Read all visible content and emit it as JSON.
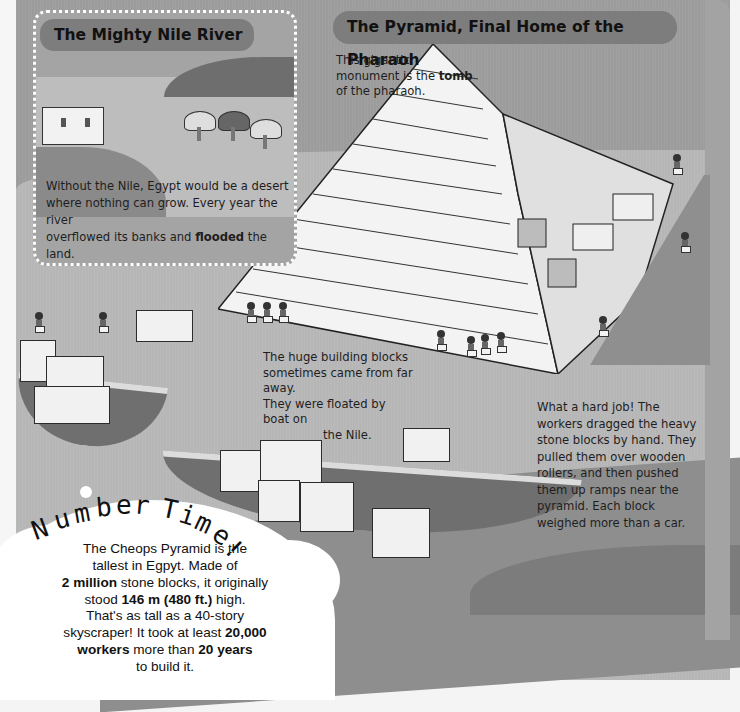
{
  "page": {
    "nile_section": {
      "title": "The Mighty Nile River",
      "body": {
        "line1": "Without the Nile, Egypt would be a desert",
        "line2": "where nothing can grow. Every year the river",
        "line3_pre": "overflowed its banks and ",
        "line3_bold": "flooded",
        "line3_post": " the land.",
        "line4": "When the waters receeded, farmers planted",
        "line5_pre": "crops in the rich mud, called ",
        "line5_bold": "silt",
        "line5_post": ", left behind."
      }
    },
    "pyramid_section": {
      "title": "The Pyramid, Final Home of the Pharaoh",
      "intro": {
        "pre": "This gigantic monument is the ",
        "bold": "tomb",
        "post": " of the pharaoh."
      },
      "blocks_caption": {
        "line1": "The huge building blocks",
        "line2": "sometimes came from far away.",
        "line3": "They were floated by boat on",
        "line4": "the Nile."
      },
      "hard_job_caption": {
        "line1": "What a hard job! The",
        "line2": "workers dragged the heavy",
        "line3": "stone blocks by hand. They",
        "line4": "pulled them over wooden",
        "line5": "rollers, and then pushed",
        "line6": "them up ramps near the",
        "line7": "pyramid. Each block",
        "line8": "weighed more than a car."
      }
    },
    "number_time": {
      "banner_letters": [
        "N",
        "u",
        "m",
        "b",
        "e",
        "r",
        " ",
        "T",
        "i",
        "m",
        "e",
        "!"
      ],
      "fact1": {
        "l1": "The Cheops Pyramid is the",
        "l2": "tallest in Egpyt. Made of",
        "l3_bold": "2 million",
        "l3_post": " stone blocks, it originally",
        "l4_pre": "stood ",
        "l4_bold": "146 m (480 ft.)",
        "l4_post": " high."
      },
      "fact2": {
        "l1": "That's as tall as a 40-story",
        "l2_pre": "skyscraper! It took at least ",
        "l2_bold": "20,000",
        "l3_bold": "workers",
        "l3_mid": " more than ",
        "l3_bold2": "20 years",
        "l4": "to build it."
      }
    },
    "colors": {
      "heading_pill": "#7d7d7d",
      "background": "#a9a9a9",
      "cloud": "#ffffff",
      "text": "#1e1e1e"
    }
  }
}
